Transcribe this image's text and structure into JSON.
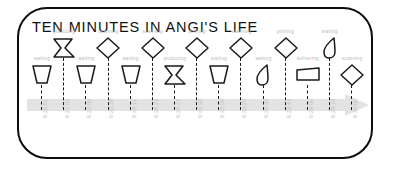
{
  "title": "TEN MINUTES IN ANGI'S LIFE",
  "colors": {
    "frame_border": "#0d0d0d",
    "title_text": "#111111",
    "shape_stroke": "#1a1a1a",
    "label_text": "#b9b9b9",
    "timestamp_text": "#c2c2c2",
    "timeline_arrow": "#e3e3e3",
    "background": "#ffffff"
  },
  "timeline": {
    "arrow_direction": "right",
    "icon": "right-arrow-band"
  },
  "events": [
    {
      "label": "waiting",
      "time": "6:20:01",
      "shape": "trapezoid",
      "row": "bottom"
    },
    {
      "label": "producing",
      "time": "6:21:02",
      "shape": "chevron-flag",
      "row": "top"
    },
    {
      "label": "waiting",
      "time": "6:22:00",
      "shape": "trapezoid",
      "row": "bottom"
    },
    {
      "label": "scanning",
      "time": "6:22:28",
      "shape": "diamond",
      "row": "top"
    },
    {
      "label": "waiting",
      "time": "6:24:11",
      "shape": "trapezoid",
      "row": "bottom"
    },
    {
      "label": "scanning",
      "time": "6:24:23",
      "shape": "diamond",
      "row": "top"
    },
    {
      "label": "producing",
      "time": "6:24:27",
      "shape": "chevron-flag",
      "row": "bottom"
    },
    {
      "label": "printing",
      "time": "6:24:30",
      "shape": "diamond",
      "row": "top"
    },
    {
      "label": "waiting",
      "time": "6:25:00",
      "shape": "trapezoid",
      "row": "bottom"
    },
    {
      "label": "scanning",
      "time": "6:25:20",
      "shape": "diamond",
      "row": "top"
    },
    {
      "label": "waiting",
      "time": "6:25:32",
      "shape": "leaf",
      "row": "bottom"
    },
    {
      "label": "printing",
      "time": "6:28:43",
      "shape": "diamond",
      "row": "top"
    },
    {
      "label": "delivering",
      "time": "6:29:00",
      "shape": "wide-trapezoid",
      "row": "bottom"
    },
    {
      "label": "waiting",
      "time": "6:29:16",
      "shape": "leaf",
      "row": "top"
    },
    {
      "label": "scanning",
      "time": "6:30:00",
      "shape": "diamond",
      "row": "bottom"
    }
  ]
}
